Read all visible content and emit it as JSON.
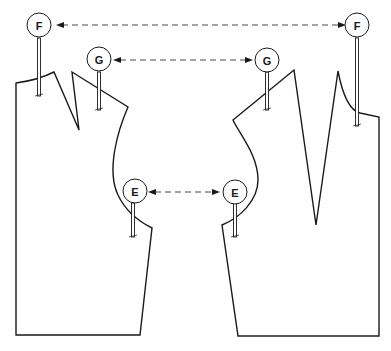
{
  "diagram": {
    "pieces": [
      {
        "name": "left-bodice-piece"
      },
      {
        "name": "right-bodice-piece"
      }
    ],
    "markers": {
      "F": {
        "label": "F"
      },
      "G": {
        "label": "G"
      },
      "E": {
        "label": "E"
      }
    },
    "colors": {
      "line": "#1a1a1a",
      "background": "#ffffff"
    }
  }
}
